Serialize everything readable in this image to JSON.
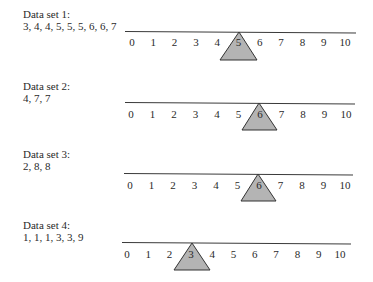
{
  "chart_data": {
    "type": "diagram",
    "title": "",
    "axis": {
      "ticks": [
        "0",
        "1",
        "2",
        "3",
        "4",
        "5",
        "6",
        "7",
        "8",
        "9",
        "10"
      ],
      "range": [
        0,
        10
      ]
    },
    "sets": [
      {
        "name": "Data set 1:",
        "values": "3, 4, 4, 5, 5, 5, 6, 6, 7",
        "fulcrum": 5
      },
      {
        "name": "Data set 2:",
        "values": "4, 7, 7",
        "fulcrum": 6
      },
      {
        "name": "Data set 3:",
        "values": "2, 8, 8",
        "fulcrum": 6
      },
      {
        "name": "Data set 4:",
        "values": "1, 1, 1, 3, 3, 9",
        "fulcrum": 3
      }
    ]
  },
  "colors": {
    "line": "#3a3a3a",
    "fulcrum_fill": "#b4b4b4",
    "fulcrum_stroke": "#333333",
    "text": "#2a2a2a"
  },
  "panels": [
    {
      "title": "Data set 1:",
      "values": "3, 4, 4, 5, 5, 5, 6, 6, 7"
    },
    {
      "title": "Data set 2:",
      "values": "4, 7, 7"
    },
    {
      "title": "Data set 3:",
      "values": "2, 8, 8"
    },
    {
      "title": "Data set 4:",
      "values": "1, 1, 1, 3, 3, 9"
    }
  ],
  "ticks": [
    "0",
    "1",
    "2",
    "3",
    "4",
    "5",
    "6",
    "7",
    "8",
    "9",
    "10"
  ]
}
